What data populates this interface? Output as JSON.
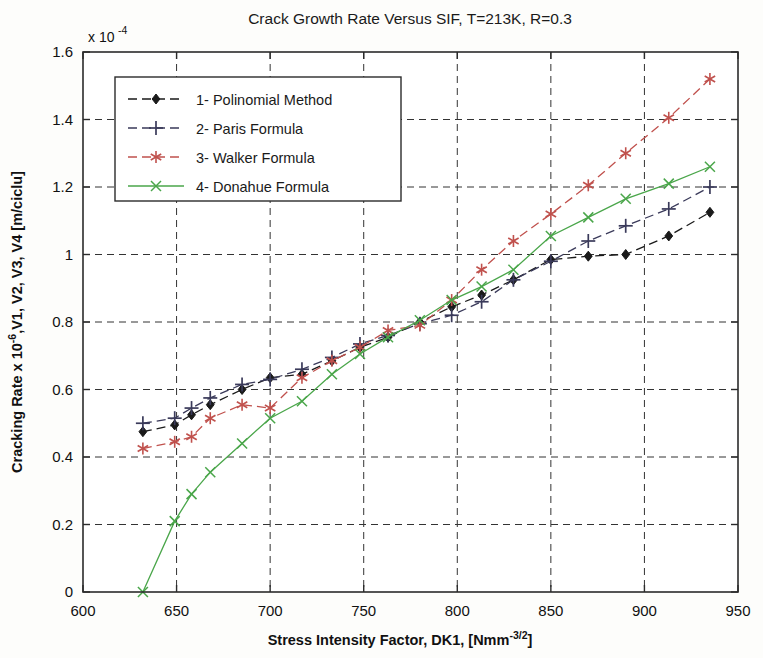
{
  "chart_data": {
    "type": "line",
    "title": "Crack Growth Rate Versus SIF, T=213K, R=0.3",
    "xlabel": "Stress Intensity Factor, DK1,  [Nmm",
    "xlabel_sup": "-3/2",
    "xlabel_tail": "]",
    "ylabel": "Cracking Rate x 10",
    "ylabel_sup": "-6",
    "ylabel_tail": ",V1, V2, V3, V4 [m/ciclu]",
    "y_multiplier_base": "x 10",
    "y_multiplier_exp": "-4",
    "xlim": [
      600,
      950
    ],
    "ylim": [
      0,
      1.6
    ],
    "xticks": [
      600,
      650,
      700,
      750,
      800,
      850,
      900,
      950
    ],
    "xtick_labels": [
      "600",
      "650",
      "700",
      "750",
      "800",
      "850",
      "900",
      "950"
    ],
    "yticks": [
      0,
      0.2,
      0.4,
      0.6,
      0.8,
      1.0,
      1.2,
      1.4,
      1.6
    ],
    "ytick_labels": [
      "0",
      "0.2",
      "0.4",
      "0.6",
      "0.8",
      "1",
      "1.2",
      "1.4",
      "1.6"
    ],
    "grid": true,
    "grid_style": "dashed",
    "legend_position": "upper-left-inside",
    "series": [
      {
        "name": "1- Polinomial Method",
        "color": "#1a1a1a",
        "marker": "diamond",
        "linestyle": "dashed",
        "x": [
          632,
          649,
          658,
          668,
          685,
          700,
          717,
          733,
          748,
          763,
          780,
          797,
          813,
          830,
          850,
          870,
          890,
          913,
          935
        ],
        "y": [
          0.475,
          0.495,
          0.525,
          0.555,
          0.6,
          0.635,
          0.645,
          0.685,
          0.725,
          0.755,
          0.8,
          0.845,
          0.88,
          0.925,
          0.985,
          0.995,
          1.0,
          1.055,
          1.125
        ]
      },
      {
        "name": "2- Paris Formula",
        "color": "#3a3a5a",
        "marker": "plus",
        "linestyle": "dashed",
        "x": [
          632,
          649,
          658,
          668,
          685,
          700,
          717,
          733,
          748,
          763,
          780,
          797,
          813,
          830,
          850,
          870,
          890,
          913,
          935
        ],
        "y": [
          0.5,
          0.515,
          0.545,
          0.575,
          0.615,
          0.63,
          0.66,
          0.695,
          0.735,
          0.76,
          0.795,
          0.82,
          0.86,
          0.925,
          0.98,
          1.04,
          1.085,
          1.135,
          1.2
        ]
      },
      {
        "name": "3- Walker Formula",
        "color": "#c0514d",
        "marker": "asterisk",
        "linestyle": "dashed",
        "x": [
          632,
          649,
          658,
          668,
          685,
          700,
          717,
          733,
          748,
          763,
          780,
          797,
          813,
          830,
          850,
          870,
          890,
          913,
          935
        ],
        "y": [
          0.425,
          0.445,
          0.46,
          0.515,
          0.555,
          0.545,
          0.635,
          0.685,
          0.725,
          0.775,
          0.79,
          0.865,
          0.955,
          1.04,
          1.12,
          1.205,
          1.3,
          1.405,
          1.52
        ]
      },
      {
        "name": "4- Donahue Formula",
        "color": "#4aa64a",
        "marker": "x",
        "linestyle": "solid",
        "x": [
          632,
          649,
          658,
          668,
          685,
          700,
          717,
          733,
          748,
          763,
          780,
          797,
          813,
          830,
          850,
          870,
          890,
          913,
          935
        ],
        "y": [
          0.0,
          0.21,
          0.29,
          0.355,
          0.44,
          0.515,
          0.565,
          0.645,
          0.705,
          0.755,
          0.805,
          0.865,
          0.905,
          0.955,
          1.055,
          1.11,
          1.165,
          1.21,
          1.26
        ]
      }
    ]
  },
  "legend": {
    "entries": [
      "1- Polinomial Method",
      "2- Paris Formula",
      "3- Walker Formula",
      "4- Donahue Formula"
    ]
  }
}
